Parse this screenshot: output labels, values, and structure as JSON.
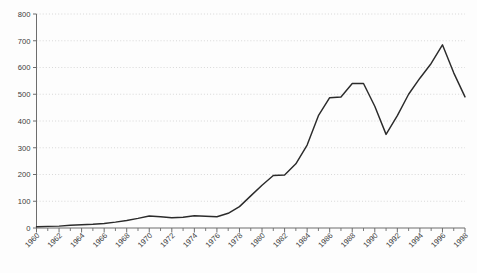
{
  "chart_data": {
    "type": "line",
    "title": "",
    "subtitle": "",
    "xlabel": "",
    "ylabel": "",
    "xlim": [
      1960,
      1998
    ],
    "ylim": [
      0,
      800
    ],
    "grid": "horizontal-dotted",
    "legend": "none",
    "y_ticks": [
      0,
      100,
      200,
      300,
      400,
      500,
      600,
      700,
      800
    ],
    "y_tick_labels": [
      "0",
      "100",
      "200",
      "300",
      "400",
      "500",
      "600",
      "700",
      "800"
    ],
    "x_tick_labels": [
      "1960",
      "1962",
      "1964",
      "1966",
      "1968",
      "1970",
      "1972",
      "1974",
      "1976",
      "1978",
      "1980",
      "1982",
      "1984",
      "1986",
      "1988",
      "1990",
      "1992",
      "1994",
      "1996",
      "1998"
    ],
    "x_minor_ticks_every": 1,
    "series": [
      {
        "name": "series-1",
        "color": "#2b2b2b",
        "x": [
          1960,
          1961,
          1962,
          1963,
          1964,
          1965,
          1966,
          1967,
          1968,
          1969,
          1970,
          1971,
          1972,
          1973,
          1974,
          1975,
          1976,
          1977,
          1978,
          1979,
          1980,
          1981,
          1982,
          1983,
          1984,
          1985,
          1986,
          1987,
          1988,
          1989,
          1990,
          1991,
          1992,
          1993,
          1994,
          1995,
          1996,
          1997,
          1998
        ],
        "values": [
          5,
          6,
          7,
          10,
          12,
          14,
          17,
          22,
          28,
          36,
          45,
          42,
          38,
          40,
          46,
          44,
          42,
          55,
          80,
          120,
          160,
          196,
          198,
          240,
          310,
          420,
          487,
          490,
          540,
          540,
          455,
          350,
          420,
          500,
          560,
          615,
          685,
          580,
          490
        ]
      }
    ]
  }
}
